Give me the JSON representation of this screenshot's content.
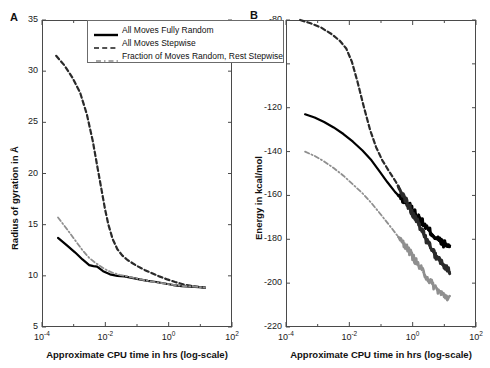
{
  "figure": {
    "panelA_letter": "A",
    "panelB_letter": "B"
  },
  "legend": {
    "position": "top-center",
    "items": [
      {
        "label": "All Moves Fully Random",
        "style": "solid",
        "color": "#000000"
      },
      {
        "label": "All Moves Stepwise",
        "style": "dashed",
        "color": "#1a1a1a"
      },
      {
        "label": "Fraction of Moves Random, Rest Stepwise",
        "style": "dashdot",
        "color": "#8a8a8a"
      }
    ]
  },
  "chart_data": [
    {
      "type": "line",
      "panel": "A",
      "title": "",
      "xlabel": "Approximate CPU time in hrs (log-scale)",
      "ylabel": "Radius of gyration in Å",
      "xscale": "log",
      "xlim": [
        0.0001,
        100
      ],
      "ylim": [
        5,
        35
      ],
      "xticks": [
        "10⁻⁴",
        "10⁻²",
        "10⁰",
        "10²"
      ],
      "xtick_values": [
        0.0001,
        0.01,
        1,
        100
      ],
      "yticks": [
        5,
        10,
        15,
        20,
        25,
        30,
        35
      ],
      "grid": false,
      "series": [
        {
          "name": "All Moves Fully Random",
          "style": "solid",
          "color": "#000000",
          "x": [
            0.00032,
            0.0006,
            0.0011,
            0.0019,
            0.0031,
            0.0042,
            0.0055,
            0.0085,
            0.014,
            0.024,
            0.04,
            0.07,
            0.12,
            0.22,
            0.4,
            0.75,
            1.4,
            2.6,
            5.0,
            9.0,
            14.0
          ],
          "y": [
            13.7,
            13.0,
            12.3,
            11.6,
            11.05,
            10.95,
            10.9,
            10.45,
            10.15,
            10.0,
            9.95,
            9.8,
            9.65,
            9.5,
            9.4,
            9.25,
            9.1,
            9.0,
            8.95,
            8.9,
            8.85
          ]
        },
        {
          "name": "All Moves Stepwise",
          "style": "dashed",
          "color": "#2a2a2a",
          "x": [
            0.00028,
            0.0005,
            0.0009,
            0.0016,
            0.0026,
            0.004,
            0.0058,
            0.0078,
            0.0098,
            0.0125,
            0.017,
            0.024,
            0.034,
            0.05,
            0.075,
            0.11,
            0.18,
            0.3,
            0.5,
            0.9,
            1.6,
            3.0,
            5.5,
            9.5,
            14.0
          ],
          "y": [
            31.5,
            30.6,
            29.4,
            27.9,
            25.8,
            23.2,
            20.4,
            18.2,
            16.5,
            15.0,
            13.6,
            12.6,
            12.0,
            11.55,
            11.2,
            10.9,
            10.55,
            10.25,
            9.95,
            9.65,
            9.4,
            9.15,
            9.0,
            8.9,
            8.85
          ]
        },
        {
          "name": "Fraction of Moves Random, Rest Stepwise",
          "style": "dashdot",
          "color": "#8f8f8f",
          "x": [
            0.00032,
            0.0006,
            0.0011,
            0.0019,
            0.0031,
            0.0045,
            0.0065,
            0.0105,
            0.017,
            0.028,
            0.047,
            0.08,
            0.14,
            0.25,
            0.45,
            0.85,
            1.6,
            3.0,
            5.5,
            9.5,
            14.0
          ],
          "y": [
            15.7,
            14.6,
            13.5,
            12.5,
            11.75,
            11.35,
            11.0,
            10.6,
            10.3,
            10.1,
            9.95,
            9.8,
            9.62,
            9.48,
            9.35,
            9.22,
            9.1,
            9.0,
            8.95,
            8.9,
            8.85
          ]
        }
      ]
    },
    {
      "type": "line",
      "panel": "B",
      "title": "",
      "xlabel": "Approximate CPU time in hrs (log-scale)",
      "ylabel": "Energy in kcal/mol",
      "xscale": "log",
      "xlim": [
        0.0001,
        100
      ],
      "ylim": [
        -220,
        -80
      ],
      "xticks": [
        "10⁻⁴",
        "10⁻²",
        "10⁰",
        "10²"
      ],
      "xtick_values": [
        0.0001,
        0.01,
        1,
        100
      ],
      "yticks": [
        -220,
        -200,
        -180,
        -160,
        -140,
        -120,
        -80
      ],
      "ytick_unlabeled": [
        -100
      ],
      "grid": false,
      "series": [
        {
          "name": "All Moves Fully Random",
          "style": "solid",
          "color": "#000000",
          "x": [
            0.0004,
            0.0008,
            0.0016,
            0.0032,
            0.0065,
            0.013,
            0.026,
            0.05,
            0.09,
            0.16,
            0.28,
            0.45,
            0.7,
            1.1,
            1.8,
            3.0,
            5.0,
            8.0,
            12.0,
            15.0
          ],
          "y": [
            -123.0,
            -124.5,
            -126.5,
            -129.0,
            -132.0,
            -135.5,
            -139.5,
            -144.0,
            -149.0,
            -154.0,
            -158.5,
            -161.5,
            -164.0,
            -167.5,
            -171.5,
            -175.5,
            -179.0,
            -181.5,
            -183.0,
            -183.5
          ]
        },
        {
          "name": "All Moves Stepwise",
          "style": "dashed",
          "color": "#2a2a2a",
          "x": [
            0.00028,
            0.0006,
            0.0013,
            0.0028,
            0.005,
            0.008,
            0.012,
            0.018,
            0.028,
            0.045,
            0.07,
            0.11,
            0.18,
            0.3,
            0.5,
            0.85,
            1.5,
            2.6,
            4.5,
            8.0,
            12.0,
            15.0
          ],
          "y": [
            -80.0,
            -81.5,
            -83.5,
            -86.5,
            -89.5,
            -93.0,
            -99.0,
            -108.0,
            -119.0,
            -130.0,
            -138.0,
            -144.0,
            -149.0,
            -154.0,
            -160.0,
            -166.5,
            -173.0,
            -180.0,
            -186.0,
            -191.0,
            -194.0,
            -195.0
          ]
        },
        {
          "name": "Fraction of Moves Random, Rest Stepwise",
          "style": "dashdot",
          "color": "#8f8f8f",
          "x": [
            0.0004,
            0.0008,
            0.0016,
            0.0032,
            0.0065,
            0.013,
            0.026,
            0.05,
            0.09,
            0.16,
            0.28,
            0.45,
            0.7,
            1.1,
            1.8,
            3.0,
            5.0,
            8.0,
            12.0,
            15.0
          ],
          "y": [
            -140.0,
            -142.0,
            -144.5,
            -147.5,
            -151.0,
            -155.0,
            -159.0,
            -163.5,
            -168.0,
            -172.5,
            -177.0,
            -181.0,
            -184.5,
            -189.0,
            -193.5,
            -198.0,
            -202.0,
            -205.0,
            -206.5,
            -207.0
          ]
        }
      ]
    }
  ]
}
